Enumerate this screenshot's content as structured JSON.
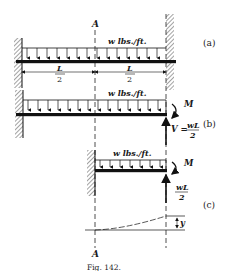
{
  "figure": {
    "caption": "Fig. 142.",
    "section_label": "A",
    "parts": {
      "a": {
        "tag": "(a)",
        "load_label": "w  lbs./ft.",
        "dim_left": {
          "num": "L",
          "den": "2"
        },
        "dim_right": {
          "num": "L",
          "den": "2"
        }
      },
      "b": {
        "tag": "(b)",
        "load_label": "w  lbs./ft.",
        "moment_label": "M",
        "shear_label": "V =",
        "shear_num": "wL",
        "shear_den": "2"
      },
      "c": {
        "tag": "(c)",
        "load_label": "w  lbs./ft.",
        "moment_label": "M",
        "shear_num": "wL",
        "shear_den": "2",
        "deflection_label": "y"
      }
    }
  }
}
